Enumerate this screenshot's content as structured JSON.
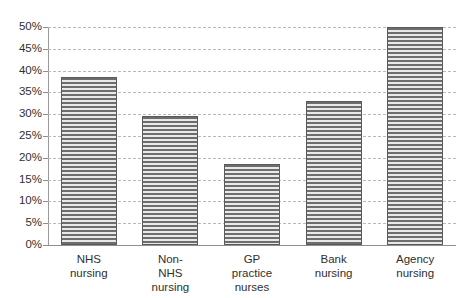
{
  "chart_data": {
    "type": "bar",
    "title": "",
    "subtitle": "",
    "xlabel": "",
    "ylabel": "",
    "categories": [
      "NHS nursing",
      "Non-NHS nursing",
      "GP practice nurses",
      "Bank nursing",
      "Agency nursing"
    ],
    "category_lines": [
      [
        "NHS",
        "nursing"
      ],
      [
        "Non-",
        "NHS",
        "nursing"
      ],
      [
        "GP",
        "practice",
        "nurses"
      ],
      [
        "Bank",
        "nursing"
      ],
      [
        "Agency",
        "nursing"
      ]
    ],
    "values": [
      38.5,
      29.5,
      18.5,
      33,
      50
    ],
    "value_labels": [
      "38.5%",
      "29.5%",
      "18.5%",
      "33%",
      "50%"
    ],
    "ylim": [
      0,
      50
    ],
    "ytick_values": [
      0,
      5,
      10,
      15,
      20,
      25,
      30,
      35,
      40,
      45,
      50
    ],
    "ytick_labels": [
      "0%",
      "5%",
      "10%",
      "15%",
      "20%",
      "25%",
      "30%",
      "35%",
      "40%",
      "45%",
      "50%"
    ],
    "grid": true,
    "grid_style": "dashed",
    "legend": null,
    "legend_position": "none",
    "bar_fill": "horizontal-stripe-hatch",
    "colors": {
      "bar_stripe_dark": "#6d6d6d",
      "bar_stripe_light": "#e8e8e8",
      "bar_border": "#5a5a5a",
      "gridline": "#b9b9b9",
      "axis": "#8f8f8f",
      "text": "#2f2f2f",
      "background": "#ffffff"
    }
  }
}
